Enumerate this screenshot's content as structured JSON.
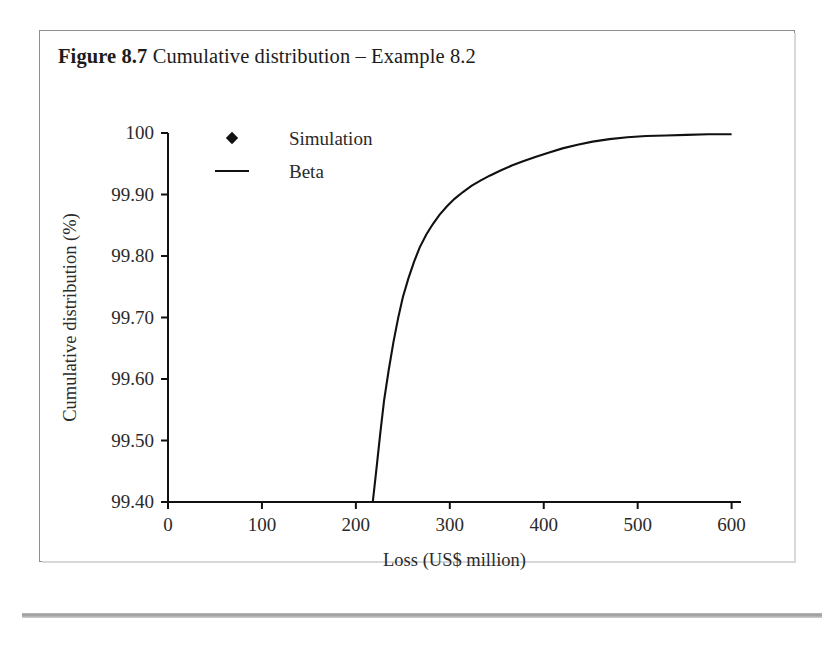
{
  "figure": {
    "caption_number": "Figure 8.7",
    "caption_text": "Cumulative distribution – Example 8.2"
  },
  "chart_data": {
    "type": "scatter",
    "title": "Cumulative distribution – Example 8.2",
    "xlabel": "Loss (US$ million)",
    "ylabel": "Cumulative distribution (%)",
    "xlim": [
      0,
      610
    ],
    "ylim": [
      99.4,
      100.0
    ],
    "xticks": [
      0,
      100,
      200,
      300,
      400,
      500,
      600
    ],
    "xtick_labels": [
      "0",
      "100",
      "200",
      "300",
      "400",
      "500",
      "600"
    ],
    "yticks": [
      99.4,
      99.5,
      99.6,
      99.7,
      99.8,
      99.9,
      100.0
    ],
    "ytick_labels": [
      "99.40",
      "99.50",
      "99.60",
      "99.70",
      "99.80",
      "99.90",
      "100"
    ],
    "grid": false,
    "legend_position": "top-left-inside",
    "series": [
      {
        "name": "Simulation",
        "marker": "diamond",
        "color": "#111111",
        "style": "markers",
        "points": [
          [
            189,
            99.465
          ],
          [
            197,
            99.578
          ],
          [
            205,
            99.63
          ],
          [
            213,
            99.7
          ],
          [
            224,
            99.74
          ],
          [
            234,
            99.772
          ],
          [
            243,
            99.8
          ],
          [
            251,
            99.82
          ],
          [
            259,
            99.832
          ],
          [
            268,
            99.846
          ],
          [
            276,
            99.856
          ],
          [
            283,
            99.87
          ],
          [
            291,
            99.884
          ],
          [
            297,
            99.896
          ],
          [
            303,
            99.903
          ],
          [
            310,
            99.912
          ],
          [
            317,
            99.92
          ],
          [
            323,
            99.93
          ],
          [
            330,
            99.94
          ],
          [
            337,
            99.944
          ],
          [
            344,
            99.944
          ],
          [
            351,
            99.944
          ],
          [
            358,
            99.948
          ],
          [
            365,
            99.958
          ],
          [
            372,
            99.964
          ],
          [
            379,
            99.97
          ],
          [
            386,
            99.972
          ],
          [
            394,
            99.98
          ],
          [
            401,
            99.984
          ],
          [
            409,
            99.988
          ],
          [
            417,
            99.992
          ],
          [
            425,
            99.996
          ],
          [
            434,
            99.997
          ],
          [
            442,
            99.997
          ],
          [
            450,
            99.997
          ],
          [
            458,
            99.997
          ],
          [
            466,
            99.997
          ],
          [
            474,
            99.997
          ],
          [
            482,
            99.998
          ],
          [
            490,
            99.998
          ],
          [
            498,
            99.998
          ],
          [
            506,
            99.998
          ],
          [
            514,
            99.998
          ],
          [
            522,
            99.998
          ],
          [
            530,
            99.998
          ],
          [
            538,
            99.998
          ],
          [
            546,
            99.998
          ],
          [
            554,
            99.998
          ],
          [
            562,
            99.998
          ],
          [
            570,
            99.998
          ],
          [
            578,
            99.998
          ],
          [
            586,
            99.998
          ],
          [
            594,
            99.998
          ],
          [
            602,
            99.998
          ],
          [
            609,
            99.998
          ]
        ]
      },
      {
        "name": "Beta",
        "marker": "none",
        "color": "#111111",
        "style": "line",
        "points": [
          [
            218,
            99.4
          ],
          [
            222,
            99.455
          ],
          [
            226,
            99.512
          ],
          [
            230,
            99.565
          ],
          [
            235,
            99.615
          ],
          [
            240,
            99.66
          ],
          [
            245,
            99.699
          ],
          [
            250,
            99.733
          ],
          [
            256,
            99.764
          ],
          [
            262,
            99.791
          ],
          [
            268,
            99.814
          ],
          [
            275,
            99.835
          ],
          [
            282,
            99.852
          ],
          [
            289,
            99.867
          ],
          [
            297,
            99.881
          ],
          [
            305,
            99.893
          ],
          [
            314,
            99.904
          ],
          [
            323,
            99.914
          ],
          [
            333,
            99.923
          ],
          [
            343,
            99.931
          ],
          [
            354,
            99.939
          ],
          [
            366,
            99.947
          ],
          [
            378,
            99.954
          ],
          [
            391,
            99.961
          ],
          [
            405,
            99.968
          ],
          [
            420,
            99.975
          ],
          [
            436,
            99.981
          ],
          [
            452,
            99.986
          ],
          [
            470,
            99.99
          ],
          [
            489,
            99.993
          ],
          [
            509,
            99.995
          ],
          [
            530,
            99.996
          ],
          [
            552,
            99.997
          ],
          [
            575,
            99.998
          ],
          [
            600,
            99.998
          ]
        ]
      }
    ],
    "legend": [
      {
        "label": "Simulation",
        "symbol": "diamond"
      },
      {
        "label": "Beta",
        "symbol": "line"
      }
    ]
  }
}
